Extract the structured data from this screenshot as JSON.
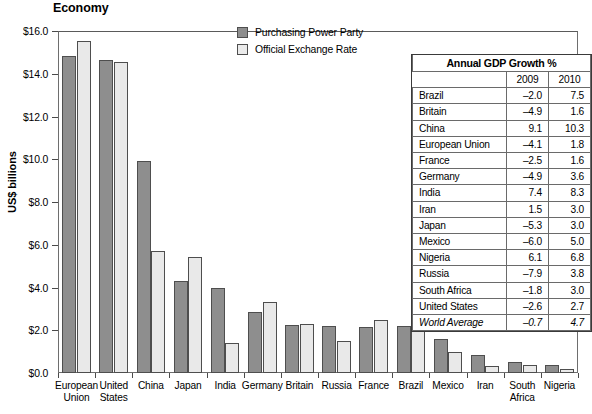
{
  "chart_data": {
    "type": "bar",
    "title": "Economy",
    "xlabel": "",
    "ylabel": "US$ billions",
    "ylim": [
      0,
      16
    ],
    "ytick_labels": [
      "$0.0",
      "$2.0",
      "$4.0",
      "$6.0",
      "$8.0",
      "$10.0",
      "$12.0",
      "$14.0",
      "$16.0"
    ],
    "ytick_values": [
      0,
      2,
      4,
      6,
      8,
      10,
      12,
      14,
      16
    ],
    "grid": false,
    "legend_position": "top-center",
    "categories": [
      "European Union",
      "United States",
      "China",
      "Japan",
      "India",
      "Germany",
      "Britain",
      "Russia",
      "France",
      "Brazil",
      "Mexico",
      "Iran",
      "South Africa",
      "Nigeria"
    ],
    "categories_wrapped": [
      [
        "European",
        "Union"
      ],
      [
        "United",
        "States"
      ],
      [
        "China"
      ],
      [
        "Japan"
      ],
      [
        "India"
      ],
      [
        "Germany"
      ],
      [
        "Britain"
      ],
      [
        "Russia"
      ],
      [
        "France"
      ],
      [
        "Brazil"
      ],
      [
        "Mexico"
      ],
      [
        "Iran"
      ],
      [
        "South",
        "Africa"
      ],
      [
        "Nigeria"
      ]
    ],
    "series": [
      {
        "name": "Purchasing Power Party",
        "color": "#8e8e8e",
        "values": [
          14.85,
          14.65,
          9.9,
          4.3,
          4.0,
          2.85,
          2.25,
          2.22,
          2.15,
          2.18,
          1.58,
          0.86,
          0.53,
          0.37
        ]
      },
      {
        "name": "Official Exchange Rate",
        "color": "#e9e9e9",
        "values": [
          15.55,
          14.55,
          5.7,
          5.45,
          1.4,
          3.3,
          2.3,
          1.48,
          2.5,
          2.0,
          1.0,
          0.35,
          0.36,
          0.19
        ]
      }
    ]
  },
  "legend": {
    "items": [
      {
        "label": "Purchasing Power Party",
        "swatch": "ppp"
      },
      {
        "label": "Official Exchange Rate",
        "swatch": "oer"
      }
    ]
  },
  "table": {
    "header": "Annual GDP Growth %",
    "columns": [
      "",
      "2009",
      "2010"
    ],
    "rows": [
      {
        "country": "Brazil",
        "y2009": "–2.0",
        "y2010": "7.5"
      },
      {
        "country": "Britain",
        "y2009": "–4.9",
        "y2010": "1.6"
      },
      {
        "country": "China",
        "y2009": "9.1",
        "y2010": "10.3"
      },
      {
        "country": "European Union",
        "y2009": "–4.1",
        "y2010": "1.8"
      },
      {
        "country": "France",
        "y2009": "–2.5",
        "y2010": "1.6"
      },
      {
        "country": "Germany",
        "y2009": "–4.9",
        "y2010": "3.6"
      },
      {
        "country": "India",
        "y2009": "7.4",
        "y2010": "8.3"
      },
      {
        "country": "Iran",
        "y2009": "1.5",
        "y2010": "3.0"
      },
      {
        "country": "Japan",
        "y2009": "–5.3",
        "y2010": "3.0"
      },
      {
        "country": "Mexico",
        "y2009": "–6.0",
        "y2010": "5.0"
      },
      {
        "country": "Nigeria",
        "y2009": "6.1",
        "y2010": "6.8"
      },
      {
        "country": "Russia",
        "y2009": "–7.9",
        "y2010": "3.8"
      },
      {
        "country": "South Africa",
        "y2009": "–1.8",
        "y2010": "3.0"
      },
      {
        "country": "United States",
        "y2009": "–2.6",
        "y2010": "2.7"
      },
      {
        "country": "World Average",
        "y2009": "–0.7",
        "y2010": "4.7",
        "italic": true
      }
    ]
  }
}
